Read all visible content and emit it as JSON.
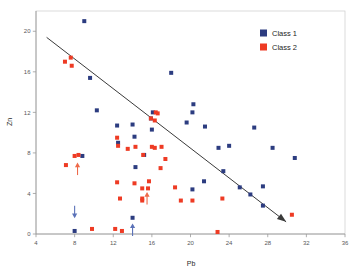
{
  "chart_data": {
    "type": "scatter",
    "title": "",
    "xlabel": "Pb",
    "ylabel": "Zn",
    "xlim": [
      4,
      36
    ],
    "ylim": [
      0,
      22
    ],
    "xticks": [
      4,
      8,
      12,
      16,
      20,
      24,
      28,
      32,
      36
    ],
    "yticks": [
      0,
      4,
      8,
      12,
      16,
      20
    ],
    "grid": false,
    "legend_position": "top-right",
    "legend": [
      {
        "name": "Class 1",
        "color": "#2c3c80",
        "marker": "square"
      },
      {
        "name": "Class 2",
        "color": "#ee3b24",
        "marker": "square"
      }
    ],
    "series": [
      {
        "name": "Class 1",
        "color": "#2c3c80",
        "points": [
          [
            9.0,
            21.0
          ],
          [
            9.6,
            15.4
          ],
          [
            10.3,
            12.2
          ],
          [
            12.4,
            10.7
          ],
          [
            12.5,
            9.0
          ],
          [
            14.0,
            10.8
          ],
          [
            14.2,
            9.6
          ],
          [
            8.8,
            7.7
          ],
          [
            14.3,
            6.6
          ],
          [
            16.1,
            12.0
          ],
          [
            15.9,
            11.4
          ],
          [
            16.0,
            10.3
          ],
          [
            15.2,
            7.8
          ],
          [
            18.0,
            15.9
          ],
          [
            20.3,
            12.8
          ],
          [
            20.2,
            12.0
          ],
          [
            19.6,
            11.0
          ],
          [
            21.5,
            10.6
          ],
          [
            22.9,
            8.5
          ],
          [
            20.2,
            4.4
          ],
          [
            21.4,
            5.2
          ],
          [
            23.4,
            6.2
          ],
          [
            24.0,
            8.7
          ],
          [
            26.6,
            10.5
          ],
          [
            25.1,
            4.6
          ],
          [
            26.2,
            3.9
          ],
          [
            27.5,
            4.7
          ],
          [
            27.5,
            2.8
          ],
          [
            28.5,
            8.5
          ],
          [
            30.8,
            7.5
          ],
          [
            14.0,
            1.6
          ],
          [
            8.0,
            0.3
          ]
        ]
      },
      {
        "name": "Class 2",
        "color": "#ee3b24",
        "points": [
          [
            7.0,
            17.0
          ],
          [
            7.6,
            17.4
          ],
          [
            7.7,
            16.6
          ],
          [
            8.4,
            7.8
          ],
          [
            8.0,
            7.7
          ],
          [
            7.1,
            6.8
          ],
          [
            12.4,
            9.5
          ],
          [
            12.5,
            8.7
          ],
          [
            13.5,
            8.4
          ],
          [
            14.3,
            8.6
          ],
          [
            15.1,
            7.8
          ],
          [
            15.9,
            11.4
          ],
          [
            16.4,
            12.0
          ],
          [
            16.6,
            11.9
          ],
          [
            16.3,
            11.2
          ],
          [
            16.0,
            8.6
          ],
          [
            16.3,
            8.5
          ],
          [
            17.0,
            8.6
          ],
          [
            17.4,
            7.4
          ],
          [
            16.9,
            6.5
          ],
          [
            15.7,
            5.2
          ],
          [
            15.6,
            4.5
          ],
          [
            15.0,
            4.5
          ],
          [
            18.4,
            4.6
          ],
          [
            12.4,
            5.1
          ],
          [
            14.2,
            5.0
          ],
          [
            15.0,
            3.3
          ],
          [
            15.0,
            3.5
          ],
          [
            12.7,
            3.5
          ],
          [
            19.0,
            3.3
          ],
          [
            20.2,
            3.3
          ],
          [
            23.3,
            3.5
          ],
          [
            9.8,
            0.5
          ],
          [
            12.2,
            0.5
          ],
          [
            12.9,
            0.3
          ],
          [
            22.8,
            0.2
          ],
          [
            30.5,
            1.9
          ]
        ]
      }
    ],
    "trendline": {
      "name": "trend-arrow",
      "color": "#3a3a3a",
      "start": [
        5.1,
        19.4
      ],
      "end": [
        29.9,
        1.2
      ],
      "arrowhead": true
    },
    "annotations": [
      {
        "name": "arrow-down-blue",
        "x": 8.0,
        "y": 1.7,
        "direction": "down",
        "color": "#5b72b8"
      },
      {
        "name": "arrow-up-blue",
        "x": 14.0,
        "y": 0.9,
        "direction": "up",
        "color": "#5b72b8"
      },
      {
        "name": "arrow-up-red-left",
        "x": 8.3,
        "y": 6.9,
        "direction": "up",
        "color": "#ee6a4a"
      },
      {
        "name": "arrow-up-red-center",
        "x": 15.5,
        "y": 4.0,
        "direction": "up",
        "color": "#ee6a4a"
      }
    ]
  }
}
